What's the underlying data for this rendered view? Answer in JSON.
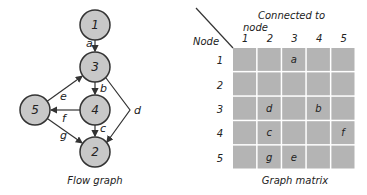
{
  "flow_graph": {
    "caption": "Flow graph",
    "nodes": [
      {
        "id": "1",
        "x": 95,
        "y": 25
      },
      {
        "id": "3",
        "x": 95,
        "y": 67
      },
      {
        "id": "4",
        "x": 95,
        "y": 110
      },
      {
        "id": "5",
        "x": 35,
        "y": 110
      },
      {
        "id": "2",
        "x": 95,
        "y": 152
      }
    ],
    "edges": [
      {
        "label": "a",
        "from": "1",
        "to": "3"
      },
      {
        "label": "b",
        "from": "3",
        "to": "4"
      },
      {
        "label": "c",
        "from": "4",
        "to": "2"
      },
      {
        "label": "d",
        "from": "3",
        "to": "2"
      },
      {
        "label": "e",
        "from": "5",
        "to": "3"
      },
      {
        "label": "f",
        "from": "4",
        "to": "5"
      },
      {
        "label": "g",
        "from": "5",
        "to": "2"
      }
    ]
  },
  "graph_matrix": {
    "caption": "Graph matrix",
    "row_header": "Node",
    "col_header_line1": "Connected to",
    "col_header_line2": "node",
    "columns": [
      "1",
      "2",
      "3",
      "4",
      "5"
    ],
    "rows": [
      {
        "node": "1",
        "cells": [
          "",
          "",
          "a",
          "",
          ""
        ]
      },
      {
        "node": "2",
        "cells": [
          "",
          "",
          "",
          "",
          ""
        ]
      },
      {
        "node": "3",
        "cells": [
          "",
          "d",
          "",
          "b",
          ""
        ]
      },
      {
        "node": "4",
        "cells": [
          "",
          "c",
          "",
          "",
          "f"
        ]
      },
      {
        "node": "5",
        "cells": [
          "",
          "g",
          "e",
          "",
          ""
        ]
      }
    ]
  },
  "colors": {
    "node_fill": "#c8c8c8",
    "cell_fill": "#b4b4b4",
    "stroke": "#333333"
  }
}
